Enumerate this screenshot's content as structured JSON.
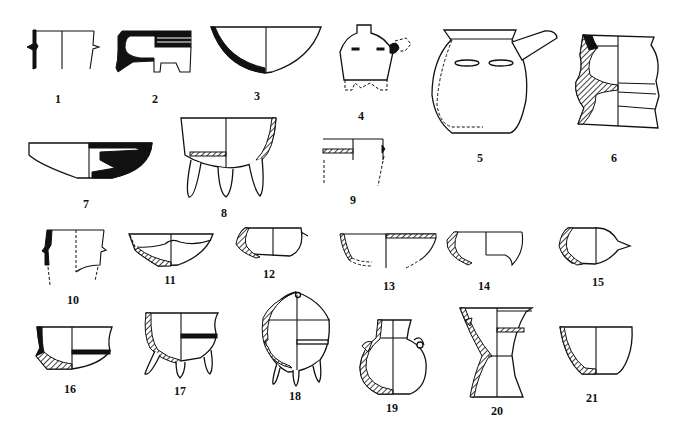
{
  "figure": {
    "items": [
      {
        "number": "1",
        "x": 58,
        "y": 93
      },
      {
        "number": "2",
        "x": 155,
        "y": 93
      },
      {
        "number": "3",
        "x": 257,
        "y": 90
      },
      {
        "number": "4",
        "x": 361,
        "y": 110
      },
      {
        "number": "5",
        "x": 480,
        "y": 152
      },
      {
        "number": "6",
        "x": 614,
        "y": 152
      },
      {
        "number": "7",
        "x": 86,
        "y": 198
      },
      {
        "number": "8",
        "x": 224,
        "y": 207
      },
      {
        "number": "9",
        "x": 353,
        "y": 194
      },
      {
        "number": "10",
        "x": 73,
        "y": 294
      },
      {
        "number": "11",
        "x": 170,
        "y": 274
      },
      {
        "number": "12",
        "x": 269,
        "y": 268
      },
      {
        "number": "13",
        "x": 389,
        "y": 280
      },
      {
        "number": "14",
        "x": 484,
        "y": 280
      },
      {
        "number": "15",
        "x": 598,
        "y": 276
      },
      {
        "number": "16",
        "x": 70,
        "y": 383
      },
      {
        "number": "17",
        "x": 180,
        "y": 385
      },
      {
        "number": "18",
        "x": 295,
        "y": 390
      },
      {
        "number": "19",
        "x": 392,
        "y": 402
      },
      {
        "number": "20",
        "x": 497,
        "y": 405
      },
      {
        "number": "21",
        "x": 592,
        "y": 392
      }
    ]
  }
}
